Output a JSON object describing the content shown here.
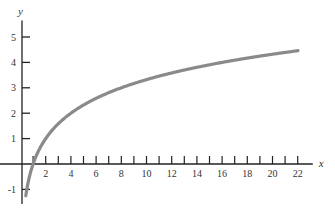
{
  "chart_data": {
    "type": "line",
    "title": "",
    "xlabel": "x",
    "ylabel": "y",
    "function": "y = log2(x)",
    "xlim": [
      0,
      23
    ],
    "ylim": [
      -1.3,
      5.7
    ],
    "grid": false,
    "legend": null,
    "x_ticks": [
      1,
      2,
      3,
      4,
      5,
      6,
      7,
      8,
      9,
      10,
      11,
      12,
      13,
      14,
      15,
      16,
      17,
      18,
      19,
      20,
      21,
      22
    ],
    "x_tick_labels": [
      "2",
      "4",
      "6",
      "8",
      "10",
      "12",
      "14",
      "16",
      "18",
      "20",
      "22"
    ],
    "y_ticks": [
      -1,
      1,
      2,
      3,
      4,
      5
    ],
    "y_tick_labels": [
      "-1",
      "1",
      "2",
      "3",
      "4",
      "5"
    ],
    "series": [
      {
        "name": "log2(x)",
        "color": "#8a8a8a",
        "x": [
          0.5,
          1,
          2,
          4,
          6,
          8,
          10,
          12,
          14,
          16,
          18,
          20,
          22
        ],
        "values": [
          -1,
          0,
          1,
          2,
          2.58,
          3,
          3.32,
          3.58,
          3.81,
          4,
          4.17,
          4.32,
          4.46
        ]
      }
    ]
  },
  "colors": {
    "axis": "#222222",
    "curve": "#8a8a8a",
    "text": "#333333"
  }
}
